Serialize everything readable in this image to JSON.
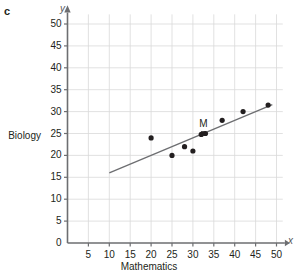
{
  "panel": {
    "letter": "c"
  },
  "chart_data": {
    "type": "scatter",
    "title": "",
    "xlabel": "Mathematics",
    "ylabel": "Biology",
    "x_axis_symbol": "x",
    "y_axis_symbol": "y",
    "xlim": [
      0,
      52
    ],
    "ylim": [
      0,
      52
    ],
    "xticks": [
      0,
      5,
      10,
      15,
      20,
      25,
      30,
      35,
      40,
      45,
      50
    ],
    "yticks": [
      0,
      5,
      10,
      15,
      20,
      25,
      30,
      35,
      40,
      45,
      50
    ],
    "xtick_labels": [
      "0",
      "5",
      "10",
      "15",
      "20",
      "25",
      "30",
      "35",
      "40",
      "45",
      "50"
    ],
    "ytick_labels": [
      "0",
      "5",
      "10",
      "15",
      "20",
      "25",
      "30",
      "35",
      "40",
      "45",
      "50"
    ],
    "grid": true,
    "grid_color": "#d9d9d9",
    "axis_color": "#6d6e71",
    "legend": null,
    "series": [
      {
        "name": "students",
        "marker": "filled-circle",
        "color": "#231f20",
        "points": [
          {
            "x": 20,
            "y": 24
          },
          {
            "x": 25,
            "y": 20
          },
          {
            "x": 28,
            "y": 22
          },
          {
            "x": 30,
            "y": 21
          },
          {
            "x": 32,
            "y": 24.8
          },
          {
            "x": 33,
            "y": 25
          },
          {
            "x": 37,
            "y": 28
          },
          {
            "x": 42,
            "y": 30
          },
          {
            "x": 48,
            "y": 31.5
          }
        ]
      }
    ],
    "annotations": [
      {
        "label": "M",
        "x": 32.5,
        "y": 25,
        "marker": "filled-square",
        "color": "#231f20"
      }
    ],
    "trendline": {
      "name": "line-of-best-fit",
      "color": "#6d6e71",
      "x1": 10,
      "y1": 16,
      "x2": 49,
      "y2": 31.6
    }
  }
}
